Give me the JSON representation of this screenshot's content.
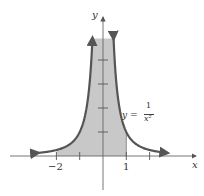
{
  "chart_data": {
    "type": "area",
    "title": "",
    "function": "y = 1/x^2",
    "xlabel": "x",
    "ylabel": "y",
    "x_tick_labels": [
      "−2",
      "1"
    ],
    "x_ticks": [
      -2,
      -1,
      1,
      2
    ],
    "y_ticks": [
      1,
      2,
      3,
      4
    ],
    "xlim": [
      -3.5,
      3.7
    ],
    "ylim": [
      -1.5,
      6
    ],
    "shaded_region": {
      "from": -2,
      "to": 1,
      "description": "area under y=1/x^2 between x=-2 and x=1"
    },
    "annotation": {
      "lhs": "y =",
      "numerator": "1",
      "denominator": "x²"
    },
    "grid": false,
    "legend": "none",
    "colors": {
      "curve": "#555555",
      "fill": "#c8c8c8",
      "axis": "#666666"
    }
  }
}
